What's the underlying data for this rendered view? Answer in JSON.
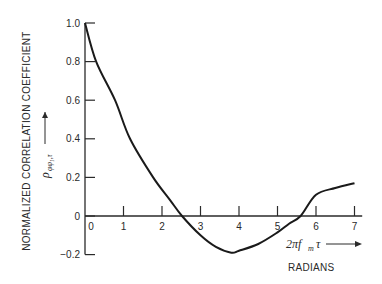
{
  "chart_data": {
    "type": "line",
    "title": "",
    "ylabel": "NORMALIZED CORRELATION COEFFICIENT",
    "ylabel_symbol": "ρ",
    "ylabel_symbol_sub": "φφ₁,τ",
    "xlabel_symbol": "2πf",
    "xlabel_symbol_sub": "m",
    "xlabel_symbol_tail": "τ",
    "xlabel_units": "RADIANS",
    "xlim": [
      0,
      7.2
    ],
    "ylim": [
      -0.2,
      1.0
    ],
    "xticks": [
      0,
      1,
      2,
      3,
      4,
      5,
      6,
      7
    ],
    "xtick_labels": [
      "0",
      "1",
      "2",
      "3",
      "4",
      "5",
      "6",
      "7"
    ],
    "yticks": [
      -0.2,
      0,
      0.2,
      0.4,
      0.6,
      0.8,
      1.0
    ],
    "ytick_labels": [
      "-0.2",
      "0",
      "0.2",
      "0.4",
      "0.6",
      "0.8",
      "1.0"
    ],
    "grid": false,
    "series": [
      {
        "name": "normalized correlation coefficient",
        "x": [
          0,
          0.29,
          0.78,
          1.17,
          1.77,
          2.2,
          2.52,
          3.0,
          3.4,
          3.8,
          4.0,
          4.5,
          5.0,
          5.3,
          5.6,
          6.0,
          6.5,
          7.0
        ],
        "y": [
          1.0,
          0.8,
          0.6,
          0.4,
          0.2,
          0.085,
          0.0,
          -0.1,
          -0.16,
          -0.19,
          -0.18,
          -0.145,
          -0.085,
          -0.04,
          0.0,
          0.11,
          0.145,
          0.17
        ]
      }
    ]
  }
}
